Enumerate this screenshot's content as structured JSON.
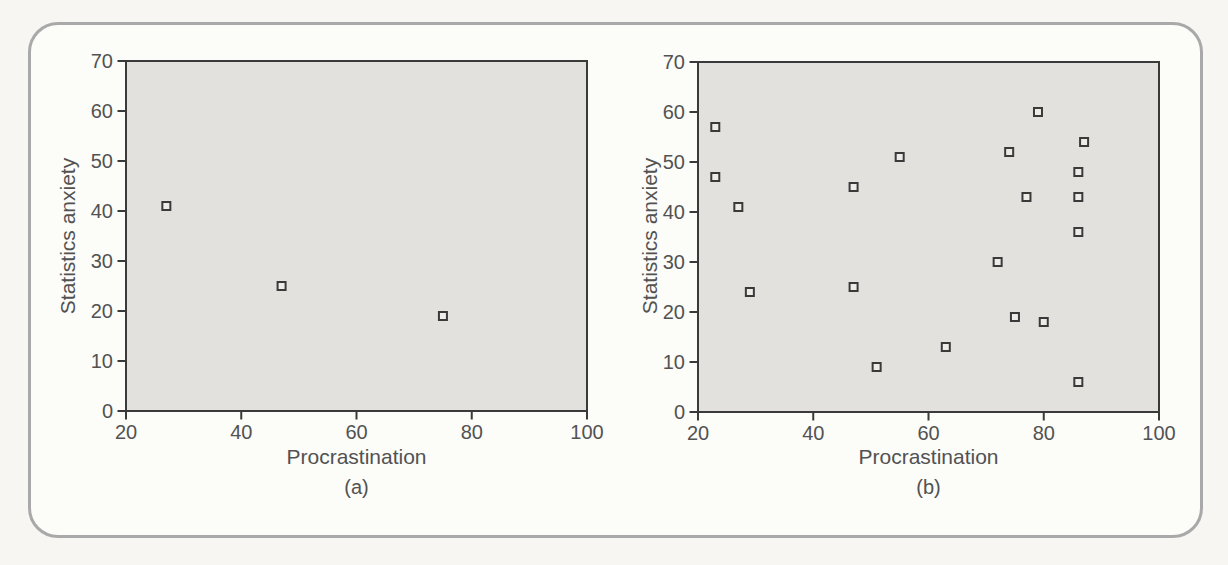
{
  "figure": {
    "background": "#f7f6f3",
    "frame": {
      "background": "#fcfcf9",
      "border_color": "#a9a9a9"
    }
  },
  "chart_data": [
    {
      "id": "a",
      "type": "scatter",
      "sublabel": "(a)",
      "xlabel": "Procrastination",
      "ylabel": "Statistics anxiety",
      "xlim": [
        20,
        100
      ],
      "ylim": [
        0,
        70
      ],
      "xticks": [
        20,
        40,
        60,
        80,
        100
      ],
      "yticks": [
        0,
        10,
        20,
        30,
        40,
        50,
        60,
        70
      ],
      "grid": false,
      "legend": "none",
      "plot_bg": "#e2e1de",
      "axis_color": "#3a3a3a",
      "text_color": "#525252",
      "marker": {
        "shape": "open-square",
        "size": 8,
        "stroke": "#3a3a3a",
        "fill": "#edece8"
      },
      "points": [
        [
          27,
          41
        ],
        [
          47,
          25
        ],
        [
          75,
          19
        ]
      ]
    },
    {
      "id": "b",
      "type": "scatter",
      "sublabel": "(b)",
      "xlabel": "Procrastination",
      "ylabel": "Statistics anxiety",
      "xlim": [
        20,
        100
      ],
      "ylim": [
        0,
        70
      ],
      "xticks": [
        20,
        40,
        60,
        80,
        100
      ],
      "yticks": [
        0,
        10,
        20,
        30,
        40,
        50,
        60,
        70
      ],
      "grid": false,
      "legend": "none",
      "plot_bg": "#e2e1de",
      "axis_color": "#3a3a3a",
      "text_color": "#525252",
      "marker": {
        "shape": "open-square",
        "size": 8,
        "stroke": "#3a3a3a",
        "fill": "#edece8"
      },
      "points": [
        [
          23,
          57
        ],
        [
          23,
          47
        ],
        [
          27,
          41
        ],
        [
          29,
          24
        ],
        [
          47,
          45
        ],
        [
          47,
          25
        ],
        [
          51,
          9
        ],
        [
          55,
          51
        ],
        [
          63,
          13
        ],
        [
          72,
          30
        ],
        [
          74,
          52
        ],
        [
          75,
          19
        ],
        [
          77,
          43
        ],
        [
          79,
          60
        ],
        [
          80,
          18
        ],
        [
          86,
          48
        ],
        [
          86,
          43
        ],
        [
          86,
          36
        ],
        [
          86,
          6
        ],
        [
          87,
          54
        ]
      ]
    }
  ]
}
